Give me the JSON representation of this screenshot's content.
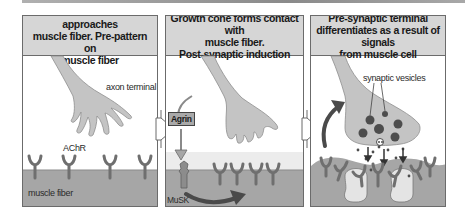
{
  "figure": {
    "panels": [
      {
        "id": "p1",
        "title": "Growth cone of axon approaches\nmuscle fiber. Pre-pattern on\nmuscle fiber",
        "labels": {
          "axon_terminal": "axon terminal",
          "achr": "AChR",
          "muscle_fiber": "muscle fiber"
        }
      },
      {
        "id": "p2",
        "title": "Growth cone forms contact with\nmuscle fiber.\nPost-synaptic induction",
        "labels": {
          "agrin": "Agrin",
          "musk": "MuSK"
        }
      },
      {
        "id": "p3",
        "title": "Pre-synaptic terminal\ndifferentiates as a result of signals\nfrom muscle cell",
        "labels": {
          "synaptic_vesicles": "synaptic vesicles"
        }
      }
    ],
    "colors": {
      "header_bg": "#d6d6d6",
      "axon_fill": "#c4c4c4",
      "muscle_fill": "#a6a6a6",
      "receptor": "#6f6f6f",
      "dark_arrow": "#4a4a4a",
      "vesicle": "#4d4d4d",
      "panel_border": "#6b6b6b"
    }
  }
}
